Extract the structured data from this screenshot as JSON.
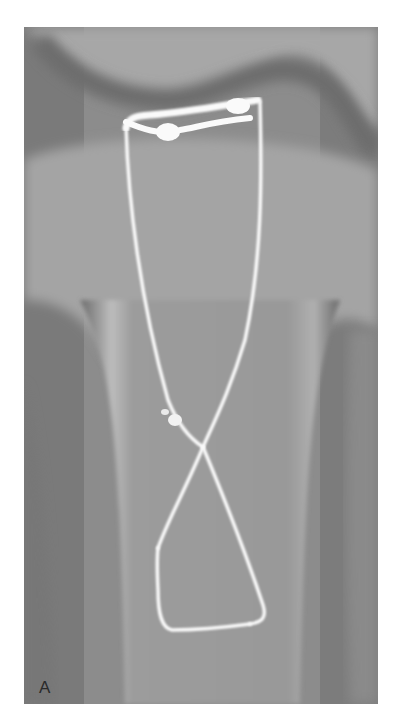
{
  "figure": {
    "panel_label": "A",
    "colors": {
      "background": "#ffffff",
      "bone": "#a8a8a8",
      "soft_tissue": "#6e6e6e",
      "wire": "#fafafa"
    }
  }
}
